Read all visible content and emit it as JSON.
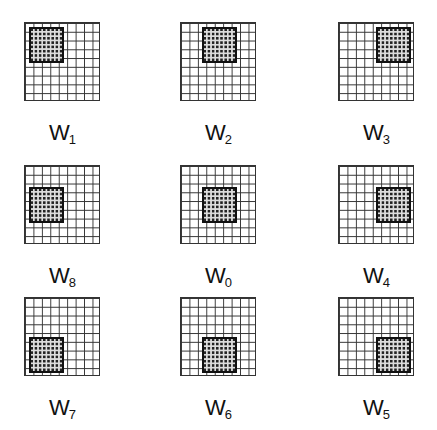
{
  "figure": {
    "panels": [
      {
        "id": "W1",
        "letter": "W",
        "sub": "1",
        "row": 0,
        "col": 0,
        "window_pos": "top-left"
      },
      {
        "id": "W2",
        "letter": "W",
        "sub": "2",
        "row": 0,
        "col": 1,
        "window_pos": "top-center"
      },
      {
        "id": "W3",
        "letter": "W",
        "sub": "3",
        "row": 0,
        "col": 2,
        "window_pos": "top-right"
      },
      {
        "id": "W8",
        "letter": "W",
        "sub": "8",
        "row": 1,
        "col": 0,
        "window_pos": "middle-left"
      },
      {
        "id": "W0",
        "letter": "W",
        "sub": "0",
        "row": 1,
        "col": 1,
        "window_pos": "center"
      },
      {
        "id": "W4",
        "letter": "W",
        "sub": "4",
        "row": 1,
        "col": 2,
        "window_pos": "middle-right"
      },
      {
        "id": "W7",
        "letter": "W",
        "sub": "7",
        "row": 2,
        "col": 0,
        "window_pos": "bottom-left"
      },
      {
        "id": "W6",
        "letter": "W",
        "sub": "6",
        "row": 2,
        "col": 1,
        "window_pos": "bottom-center"
      },
      {
        "id": "W5",
        "letter": "W",
        "sub": "5",
        "row": 2,
        "col": 2,
        "window_pos": "bottom-right"
      }
    ],
    "grid_cells": 9,
    "window_cells": 4
  }
}
